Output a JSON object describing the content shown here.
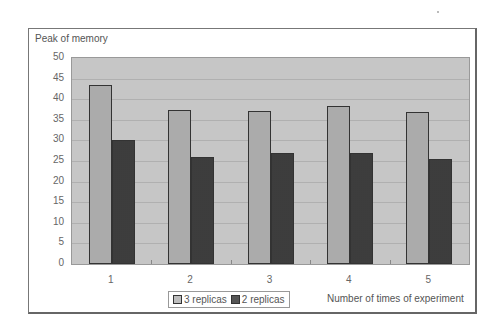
{
  "chart_data": {
    "type": "bar",
    "title": "",
    "xlabel": "Number of times of experiment",
    "ylabel": "Peak of memory",
    "categories": [
      "1",
      "2",
      "3",
      "4",
      "5"
    ],
    "series": [
      {
        "name": "3 replicas",
        "values": [
          43.5,
          37.3,
          37.2,
          38.3,
          37.0
        ]
      },
      {
        "name": "2 replicas",
        "values": [
          30.0,
          26.0,
          27.0,
          27.0,
          25.5
        ]
      }
    ],
    "ylim": [
      0,
      50
    ],
    "yticks": [
      0,
      5,
      10,
      15,
      20,
      25,
      30,
      35,
      40,
      45,
      50
    ],
    "grid": true,
    "legend_position": "bottom"
  },
  "legend": {
    "items": [
      {
        "label": "3 replicas"
      },
      {
        "label": "2 replicas"
      }
    ]
  }
}
